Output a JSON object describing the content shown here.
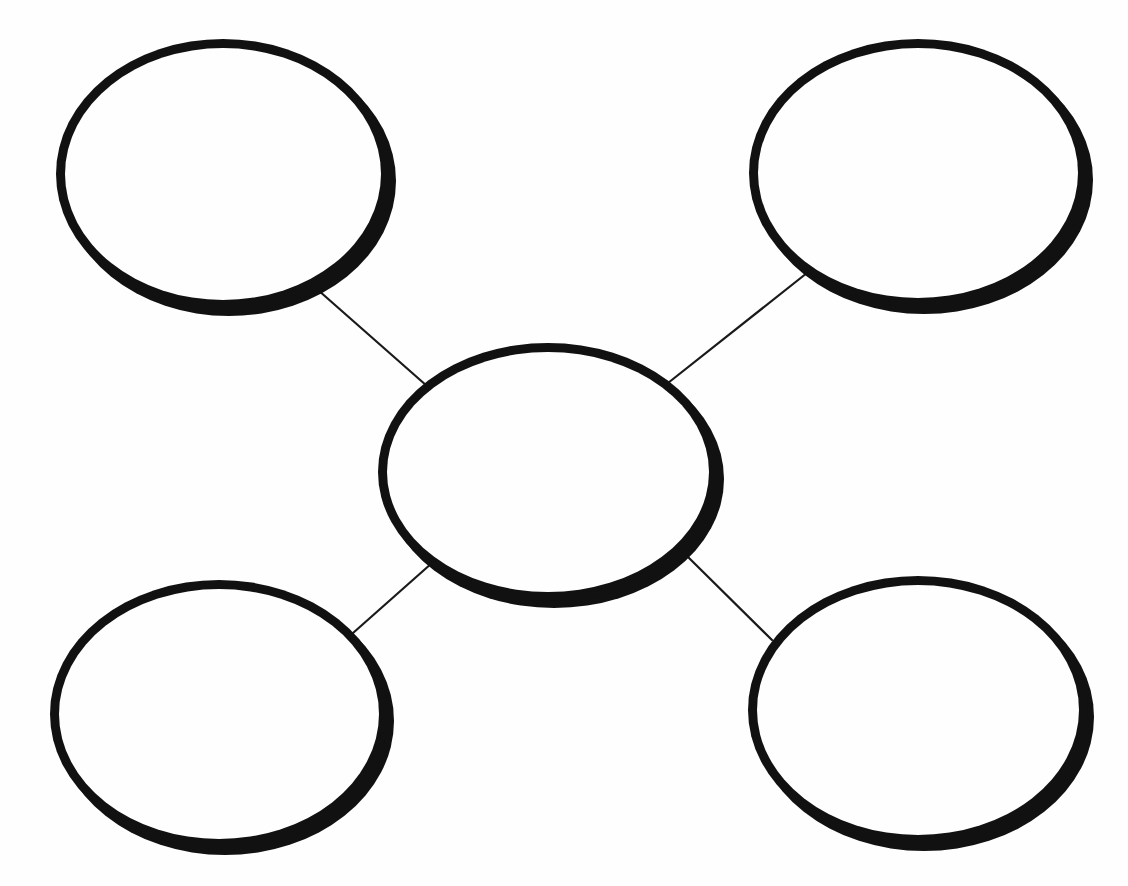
{
  "document": {
    "title": "Concept Map Graphic Organizer",
    "type": "blank-worksheet",
    "background_color": "#fefefe",
    "ink_color": "#111111",
    "canvas": {
      "width": 1128,
      "height": 886
    }
  },
  "diagram": {
    "kind": "concept-map",
    "layout": "central-node-with-four-satellites",
    "node_count": 5,
    "connector_count": 4,
    "nodes": [
      {
        "id": "center",
        "role": "central-topic",
        "label": "",
        "cx": 548,
        "cy": 472,
        "rx": 170,
        "ry": 129,
        "stroke_width": 9,
        "shadow_offset_x": 6,
        "shadow_offset_y": 7
      },
      {
        "id": "top-left",
        "role": "supporting-idea",
        "label": "",
        "cx": 223,
        "cy": 174,
        "rx": 167,
        "ry": 135,
        "stroke_width": 9,
        "shadow_offset_x": 6,
        "shadow_offset_y": 7
      },
      {
        "id": "top-right",
        "role": "supporting-idea",
        "label": "",
        "cx": 918,
        "cy": 173,
        "rx": 169,
        "ry": 134,
        "stroke_width": 9,
        "shadow_offset_x": 6,
        "shadow_offset_y": 7
      },
      {
        "id": "bottom-left",
        "role": "supporting-idea",
        "label": "",
        "cx": 219,
        "cy": 714,
        "rx": 169,
        "ry": 134,
        "stroke_width": 9,
        "shadow_offset_x": 6,
        "shadow_offset_y": 7
      },
      {
        "id": "bottom-right",
        "role": "supporting-idea",
        "label": "",
        "cx": 918,
        "cy": 710,
        "rx": 170,
        "ry": 134,
        "stroke_width": 9,
        "shadow_offset_x": 6,
        "shadow_offset_y": 7
      }
    ],
    "connectors": [
      {
        "id": "center-to-top-left",
        "from": "top-left",
        "to": "center",
        "x1": 318,
        "y1": 290,
        "x2": 427,
        "y2": 386
      },
      {
        "id": "center-to-top-right",
        "from": "top-right",
        "to": "center",
        "x1": 812,
        "y1": 269,
        "x2": 668,
        "y2": 383
      },
      {
        "id": "center-to-bottom-left",
        "from": "bottom-left",
        "to": "center",
        "x1": 353,
        "y1": 633,
        "x2": 432,
        "y2": 563
      },
      {
        "id": "center-to-bottom-right",
        "from": "bottom-right",
        "to": "center",
        "x1": 772,
        "y1": 640,
        "x2": 688,
        "y2": 557
      }
    ]
  }
}
